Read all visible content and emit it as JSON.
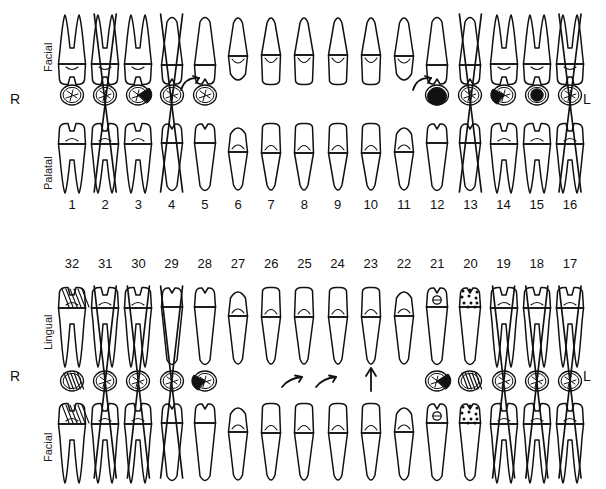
{
  "chart": {
    "type": "dental-odontogram",
    "side_labels": {
      "right": "R",
      "left": "L"
    },
    "background_color": "#ffffff",
    "ink_color": "#111111"
  },
  "maxillary": {
    "name": "Maxillary Arch",
    "row_labels": {
      "top": "Facial",
      "bottom": "Palatal"
    },
    "side_right": "R",
    "side_left": "L",
    "numbers": [
      "1",
      "2",
      "3",
      "4",
      "5",
      "6",
      "7",
      "8",
      "9",
      "10",
      "11",
      "12",
      "13",
      "14",
      "15",
      "16"
    ],
    "teeth": [
      {
        "number": "1",
        "type": "molar",
        "missing": false,
        "occlusal_fill": "outline",
        "annotation": ""
      },
      {
        "number": "2",
        "type": "molar",
        "missing": true,
        "occlusal_fill": "outline",
        "annotation": ""
      },
      {
        "number": "3",
        "type": "molar",
        "missing": false,
        "occlusal_fill": "distal-filled",
        "annotation": ""
      },
      {
        "number": "4",
        "type": "premolar",
        "missing": true,
        "occlusal_fill": "outline",
        "annotation": ""
      },
      {
        "number": "5",
        "type": "premolar",
        "missing": false,
        "occlusal_fill": "outline",
        "annotation": "rotation-arrow"
      },
      {
        "number": "6",
        "type": "canine",
        "missing": false,
        "occlusal_fill": "none",
        "annotation": ""
      },
      {
        "number": "7",
        "type": "incisor",
        "missing": false,
        "occlusal_fill": "none",
        "annotation": ""
      },
      {
        "number": "8",
        "type": "incisor",
        "missing": false,
        "occlusal_fill": "none",
        "annotation": ""
      },
      {
        "number": "9",
        "type": "incisor",
        "missing": false,
        "occlusal_fill": "none",
        "annotation": ""
      },
      {
        "number": "10",
        "type": "incisor",
        "missing": false,
        "occlusal_fill": "none",
        "annotation": ""
      },
      {
        "number": "11",
        "type": "canine",
        "missing": false,
        "occlusal_fill": "none",
        "annotation": ""
      },
      {
        "number": "12",
        "type": "premolar",
        "missing": false,
        "occlusal_fill": "full-filled",
        "annotation": "rotation-arrow"
      },
      {
        "number": "13",
        "type": "premolar",
        "missing": true,
        "occlusal_fill": "outline",
        "annotation": ""
      },
      {
        "number": "14",
        "type": "molar",
        "missing": false,
        "occlusal_fill": "mesial-filled",
        "annotation": ""
      },
      {
        "number": "15",
        "type": "molar",
        "missing": false,
        "occlusal_fill": "center-filled",
        "annotation": ""
      },
      {
        "number": "16",
        "type": "molar",
        "missing": true,
        "occlusal_fill": "outline",
        "annotation": ""
      }
    ]
  },
  "mandibular": {
    "name": "Mandibular Arch",
    "row_labels": {
      "top": "Lingual",
      "bottom": "Facial"
    },
    "side_right": "R",
    "side_left": "L",
    "numbers": [
      "32",
      "31",
      "30",
      "29",
      "28",
      "27",
      "26",
      "25",
      "24",
      "23",
      "22",
      "21",
      "20",
      "19",
      "18",
      "17"
    ],
    "teeth": [
      {
        "number": "32",
        "type": "molar",
        "missing": false,
        "occlusal_fill": "hatched",
        "annotation": "",
        "crown": "hatched"
      },
      {
        "number": "31",
        "type": "molar",
        "missing": true,
        "occlusal_fill": "outline",
        "annotation": "",
        "crown": ""
      },
      {
        "number": "30",
        "type": "molar",
        "missing": true,
        "occlusal_fill": "outline",
        "annotation": "",
        "crown": ""
      },
      {
        "number": "29",
        "type": "premolar",
        "missing": true,
        "occlusal_fill": "outline",
        "annotation": "",
        "crown": ""
      },
      {
        "number": "28",
        "type": "premolar",
        "missing": false,
        "occlusal_fill": "mesial-filled",
        "annotation": "",
        "crown": ""
      },
      {
        "number": "27",
        "type": "canine",
        "missing": false,
        "occlusal_fill": "none",
        "annotation": "",
        "crown": ""
      },
      {
        "number": "26",
        "type": "incisor",
        "missing": false,
        "occlusal_fill": "none",
        "annotation": "",
        "crown": ""
      },
      {
        "number": "25",
        "type": "incisor",
        "missing": false,
        "occlusal_fill": "none",
        "annotation": "tip-arrow",
        "crown": ""
      },
      {
        "number": "24",
        "type": "incisor",
        "missing": false,
        "occlusal_fill": "none",
        "annotation": "tip-arrow",
        "crown": ""
      },
      {
        "number": "23",
        "type": "incisor",
        "missing": false,
        "occlusal_fill": "none",
        "annotation": "up-arrow",
        "crown": ""
      },
      {
        "number": "22",
        "type": "canine",
        "missing": false,
        "occlusal_fill": "none",
        "annotation": "",
        "crown": ""
      },
      {
        "number": "21",
        "type": "premolar",
        "missing": false,
        "occlusal_fill": "distal-filled",
        "annotation": "",
        "crown": "ring"
      },
      {
        "number": "20",
        "type": "premolar",
        "missing": false,
        "occlusal_fill": "hatched",
        "annotation": "",
        "crown": "dotted"
      },
      {
        "number": "19",
        "type": "molar",
        "missing": true,
        "occlusal_fill": "outline",
        "annotation": "",
        "crown": ""
      },
      {
        "number": "18",
        "type": "molar",
        "missing": true,
        "occlusal_fill": "outline",
        "annotation": "",
        "crown": ""
      },
      {
        "number": "17",
        "type": "molar",
        "missing": true,
        "occlusal_fill": "outline",
        "annotation": "",
        "crown": ""
      }
    ]
  },
  "legend": {
    "missing_mark": "X",
    "filled_surface": "caries / restoration",
    "rotation_arrow": "rotation",
    "up_arrow": "eruption"
  }
}
